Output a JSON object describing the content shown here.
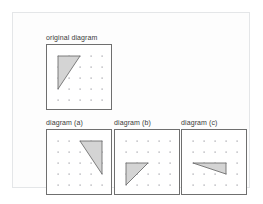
{
  "page": {
    "background_color": "#ffffff",
    "frame_border_color": "#e4e6e8"
  },
  "style": {
    "box_border_color": "#6f6f6f",
    "dot_color": "#9a9aa2",
    "shape_fill": "#d4d4d4",
    "shape_stroke": "#6f6f6f"
  },
  "figures": [
    {
      "id": "original",
      "label": "original diagram",
      "box": {
        "width": 66,
        "height": 66
      },
      "grid": {
        "cols": 5,
        "rows": 5,
        "spacing": 11,
        "offset_x": 11,
        "offset_y": 11
      },
      "shape": {
        "type": "triangle",
        "points": "11,11 33,11 11,44",
        "description": "right triangle, vertical left edge at top-left of grid"
      }
    },
    {
      "id": "a",
      "label": "diagram (a)",
      "box": {
        "width": 66,
        "height": 66
      },
      "grid": {
        "cols": 5,
        "rows": 5,
        "spacing": 11,
        "offset_x": 11,
        "offset_y": 11
      },
      "shape": {
        "type": "triangle",
        "points": "33,11 55,11 55,44",
        "description": "right triangle mirrored, vertical right edge at top-right of grid"
      }
    },
    {
      "id": "b",
      "label": "diagram (b)",
      "box": {
        "width": 66,
        "height": 66
      },
      "grid": {
        "cols": 5,
        "rows": 5,
        "spacing": 11,
        "offset_x": 11,
        "offset_y": 11
      },
      "shape": {
        "type": "triangle",
        "points": "11,33 33,33 11,55",
        "description": "right triangle translated down, vertical left edge at lower-left of grid"
      }
    },
    {
      "id": "c",
      "label": "diagram (c)",
      "box": {
        "width": 66,
        "height": 66
      },
      "grid": {
        "cols": 5,
        "rows": 5,
        "spacing": 11,
        "offset_x": 11,
        "offset_y": 11
      },
      "shape": {
        "type": "triangle",
        "points": "11,33 44,33 44,44",
        "description": "right triangle rotated, horizontal top edge and vertical right edge"
      }
    }
  ]
}
